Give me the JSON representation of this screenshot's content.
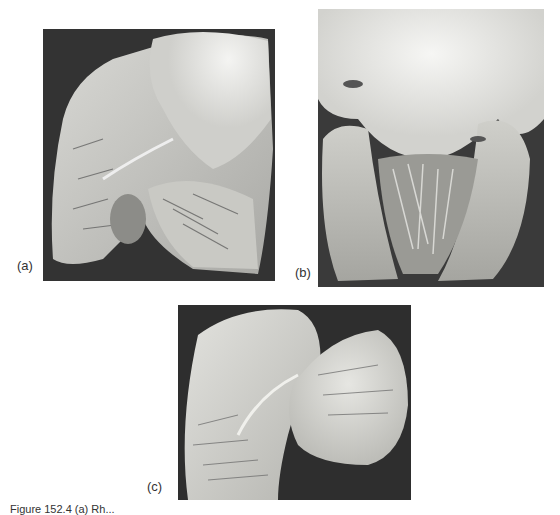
{
  "figure": {
    "panels": [
      {
        "id": "a",
        "label": "(a)",
        "description": "Opened heart specimen showing chambers with trabeculated muscle and valve leaflets, grayscale photograph"
      },
      {
        "id": "b",
        "label": "(b)",
        "description": "Opened heart specimen with pale valve tissue at top and ventricular chambers below, grayscale photograph"
      },
      {
        "id": "c",
        "label": "(c)",
        "description": "Opened heart specimen showing trabeculated ventricle on left and smooth-walled chamber on right, grayscale photograph"
      }
    ],
    "caption": "Figure 152.4 (a) Rh..."
  }
}
